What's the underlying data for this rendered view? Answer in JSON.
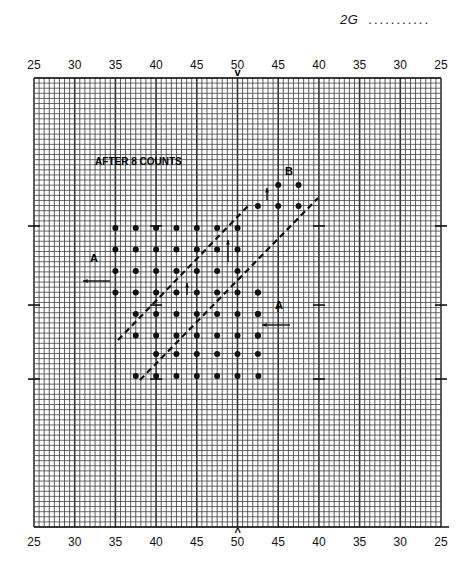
{
  "header": {
    "page_code": "2G",
    "leader": "..........."
  },
  "field": {
    "top_yard_labels": [
      "25",
      "30",
      "35",
      "40",
      "45",
      "50",
      "45",
      "40",
      "35",
      "30",
      "25"
    ],
    "bottom_yard_labels": [
      "25",
      "30",
      "35",
      "40",
      "45",
      "50",
      "45",
      "40",
      "35",
      "30",
      "25"
    ],
    "center_marker_top": "v",
    "center_marker_bottom": "^"
  },
  "diagram": {
    "title": "AFTER 8 COUNTS",
    "group_a_label": "A",
    "group_b_label": "B",
    "a_arrow_direction": "left",
    "b_arrow_direction": "up"
  }
}
